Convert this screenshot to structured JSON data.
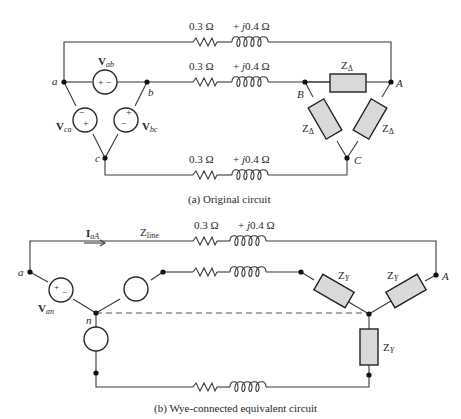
{
  "figure": {
    "part_a": {
      "caption": "(a) Original circuit",
      "line_resistance": "0.3 Ω",
      "line_reactance": "+ j0.4 Ω",
      "source_labels": {
        "ab": "ab",
        "bc": "bc",
        "ca": "ca",
        "V": "V"
      },
      "source_nodes": [
        "a",
        "b",
        "c"
      ],
      "load_nodes": [
        "A",
        "B",
        "C"
      ],
      "load_impedance": {
        "Z": "Z",
        "sub": "Δ"
      },
      "polarity": {
        "plus": "+",
        "minus": "−"
      }
    },
    "part_b": {
      "caption": "(b) Wye-connected equivalent circuit",
      "current_label": {
        "I": "I",
        "sub": "aA"
      },
      "zline_label": {
        "Z": "Z",
        "sub": "line"
      },
      "line_resistance": "0.3 Ω",
      "line_reactance": "+ j0.4 Ω",
      "source_label": {
        "V": "V",
        "sub": "an"
      },
      "nodes": {
        "a": "a",
        "n": "n",
        "A": "A"
      },
      "load_impedance": {
        "Z": "Z",
        "sub": "Y"
      },
      "polarity": {
        "plus": "+",
        "minus": "−"
      }
    },
    "colors": {
      "wire": "#3a3a3a",
      "impedance_fill": "#d9d9d9",
      "impedance_stroke": "#222222",
      "node": "#111111",
      "background": "#ffffff"
    }
  }
}
